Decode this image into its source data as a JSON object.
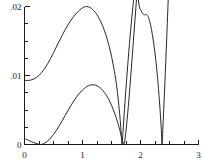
{
  "chart_data": {
    "type": "line",
    "title": "",
    "subtitle": "",
    "xlabel": "",
    "ylabel": "",
    "xlim": [
      0,
      3
    ],
    "ylim": [
      0,
      0.02
    ],
    "grid": false,
    "legend": "none",
    "x_ticks": [
      0,
      0.25,
      0.5,
      0.75,
      1,
      1.25,
      1.5,
      1.75,
      2,
      2.25,
      2.5,
      2.75,
      3
    ],
    "x_tick_labels": [
      "0",
      "",
      "",
      "",
      "1",
      "",
      "",
      "",
      "2",
      "",
      "",
      "",
      "3"
    ],
    "x_major_labels": [
      "0",
      "1",
      "2",
      "3"
    ],
    "x_major_values": [
      0,
      1,
      2,
      3
    ],
    "y_ticks": [
      0,
      0.0025,
      0.005,
      0.0075,
      0.01,
      0.0125,
      0.015,
      0.0175,
      0.02
    ],
    "y_tick_labels": [
      "0",
      "",
      "",
      "",
      ".01",
      "",
      "",
      "",
      ".02"
    ],
    "y_major_labels": [
      "0",
      ".01",
      ".02"
    ],
    "y_major_values": [
      0,
      0.01,
      0.02
    ],
    "series": [
      {
        "name": "upper-curve",
        "color": "#262626",
        "points": [
          [
            0.0,
            0.0093
          ],
          [
            0.05,
            0.00928
          ],
          [
            0.1,
            0.00932
          ],
          [
            0.15,
            0.00945
          ],
          [
            0.2,
            0.00968
          ],
          [
            0.25,
            0.01002
          ],
          [
            0.3,
            0.01048
          ],
          [
            0.35,
            0.01105
          ],
          [
            0.4,
            0.01172
          ],
          [
            0.45,
            0.01248
          ],
          [
            0.5,
            0.0133
          ],
          [
            0.55,
            0.01415
          ],
          [
            0.6,
            0.015
          ],
          [
            0.65,
            0.01583
          ],
          [
            0.7,
            0.01662
          ],
          [
            0.75,
            0.01735
          ],
          [
            0.8,
            0.018
          ],
          [
            0.85,
            0.01857
          ],
          [
            0.9,
            0.01906
          ],
          [
            0.95,
            0.01948
          ],
          [
            1.0,
            0.0198
          ],
          [
            1.05,
            0.01998
          ],
          [
            1.1,
            0.01996
          ],
          [
            1.15,
            0.01975
          ],
          [
            1.2,
            0.01936
          ],
          [
            1.25,
            0.0188
          ],
          [
            1.3,
            0.01806
          ],
          [
            1.35,
            0.01712
          ],
          [
            1.4,
            0.01596
          ],
          [
            1.45,
            0.01452
          ],
          [
            1.5,
            0.01278
          ],
          [
            1.55,
            0.0106
          ],
          [
            1.58,
            0.009
          ],
          [
            1.61,
            0.007
          ],
          [
            1.64,
            0.0045
          ],
          [
            1.66,
            0.0025
          ],
          [
            1.675,
            0.0006
          ],
          [
            1.682,
            0.0
          ],
          [
            1.69,
            0.0008
          ],
          [
            1.71,
            0.0033
          ],
          [
            1.74,
            0.007
          ],
          [
            1.78,
            0.0115
          ],
          [
            1.82,
            0.0156
          ],
          [
            1.86,
            0.0192
          ],
          [
            1.89,
            0.0216
          ],
          [
            1.92,
            0.024
          ]
        ]
      },
      {
        "name": "upper-curve-second-branch",
        "color": "#262626",
        "points": [
          [
            1.92,
            0.024
          ],
          [
            1.95,
            0.0218
          ],
          [
            1.98,
            0.02
          ],
          [
            2.01,
            0.0194
          ],
          [
            2.04,
            0.01895
          ],
          [
            2.07,
            0.01878
          ],
          [
            2.1,
            0.01885
          ],
          [
            2.13,
            0.01855
          ],
          [
            2.16,
            0.0178
          ],
          [
            2.19,
            0.01665
          ],
          [
            2.22,
            0.0151
          ],
          [
            2.25,
            0.0132
          ],
          [
            2.28,
            0.0109
          ],
          [
            2.31,
            0.0081
          ],
          [
            2.34,
            0.0047
          ],
          [
            2.36,
            0.002
          ],
          [
            2.372,
            0.0
          ],
          [
            2.39,
            0.0032
          ],
          [
            2.42,
            0.0088
          ],
          [
            2.45,
            0.015
          ],
          [
            2.48,
            0.0215
          ],
          [
            2.5,
            0.026
          ]
        ]
      },
      {
        "name": "lower-curve",
        "color": "#262626",
        "points": [
          [
            0.0,
            0.00088
          ],
          [
            0.04,
            0.00072
          ],
          [
            0.08,
            0.00056
          ],
          [
            0.12,
            0.00041
          ],
          [
            0.16,
            0.00027
          ],
          [
            0.2,
            0.00015
          ],
          [
            0.24,
            6e-05
          ],
          [
            0.275,
            0.0
          ],
          [
            0.31,
            7e-05
          ],
          [
            0.35,
            0.00022
          ],
          [
            0.4,
            0.00052
          ],
          [
            0.45,
            0.00093
          ],
          [
            0.5,
            0.00145
          ],
          [
            0.55,
            0.00205
          ],
          [
            0.6,
            0.00272
          ],
          [
            0.65,
            0.00344
          ],
          [
            0.7,
            0.00418
          ],
          [
            0.75,
            0.00492
          ],
          [
            0.8,
            0.00564
          ],
          [
            0.85,
            0.00631
          ],
          [
            0.9,
            0.00692
          ],
          [
            0.95,
            0.00745
          ],
          [
            1.0,
            0.0079
          ],
          [
            1.05,
            0.00826
          ],
          [
            1.1,
            0.00851
          ],
          [
            1.15,
            0.00864
          ],
          [
            1.2,
            0.00864
          ],
          [
            1.25,
            0.00851
          ],
          [
            1.3,
            0.00824
          ],
          [
            1.35,
            0.00783
          ],
          [
            1.4,
            0.00727
          ],
          [
            1.45,
            0.00656
          ],
          [
            1.5,
            0.00568
          ],
          [
            1.55,
            0.00462
          ],
          [
            1.6,
            0.00338
          ],
          [
            1.64,
            0.0022
          ],
          [
            1.67,
            0.00118
          ],
          [
            1.7,
            0.0003
          ],
          [
            1.715,
            0.0
          ],
          [
            1.73,
            0.0006
          ],
          [
            1.76,
            0.0028
          ],
          [
            1.8,
            0.0065
          ],
          [
            1.84,
            0.0108
          ],
          [
            1.88,
            0.0153
          ],
          [
            1.92,
            0.0198
          ],
          [
            1.96,
            0.0242
          ]
        ]
      }
    ],
    "annotations": [
      {
        "text": "zero near x = 1.68"
      },
      {
        "text": "zero near x = 1.72"
      },
      {
        "text": "zero near x = 2.37"
      }
    ]
  },
  "colors": {
    "axis": "#1a1a1a",
    "curve": "#262626",
    "background": "#ffffff"
  }
}
